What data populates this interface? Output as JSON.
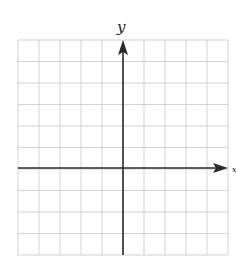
{
  "figure": {
    "type": "coordinate-grid",
    "x_axis_label": "x",
    "y_axis_label": "y",
    "grid": {
      "columns": 10,
      "rows": 10,
      "origin_column": 5,
      "origin_row_from_top": 6
    },
    "colors": {
      "grid": "#c8c8c8",
      "axis": "#2a2a2a",
      "background": "#ffffff"
    }
  }
}
